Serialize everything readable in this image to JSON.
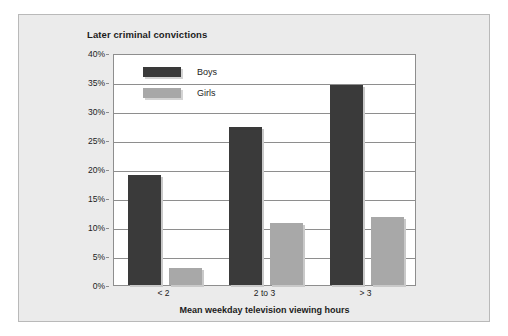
{
  "chart_data": {
    "type": "bar",
    "title": "Later criminal convictions",
    "xlabel": "Mean weekday television viewing hours",
    "ylabel": "",
    "categories": [
      "< 2",
      "2 to 3",
      "> 3"
    ],
    "series": [
      {
        "name": "Boys",
        "color": "#3a3a3a",
        "values": [
          19.0,
          27.3,
          34.5
        ]
      },
      {
        "name": "Girls",
        "color": "#a8a8a8",
        "values": [
          3.0,
          10.7,
          11.7
        ]
      }
    ],
    "ylim": [
      0,
      40
    ],
    "ytick_values": [
      0,
      5,
      10,
      15,
      20,
      25,
      30,
      35,
      40
    ],
    "ytick_labels": [
      "0%",
      "5%",
      "10%",
      "15%",
      "20%",
      "25%",
      "30%",
      "35%",
      "40%"
    ],
    "grid": true,
    "legend_position": "top-left-inside",
    "value_unit": "%"
  },
  "panel": {
    "background_color": "#ebebeb",
    "border_color": "#b9b9b9"
  }
}
